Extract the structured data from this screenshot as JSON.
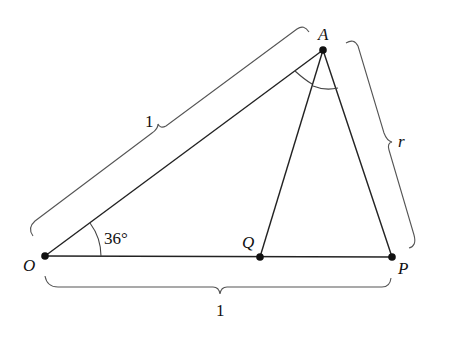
{
  "figure": {
    "points": {
      "O": {
        "label": "O",
        "x": 45,
        "y": 256
      },
      "Q": {
        "label": "Q",
        "x": 260,
        "y": 257
      },
      "P": {
        "label": "P",
        "x": 392,
        "y": 257
      },
      "A": {
        "label": "A",
        "x": 323,
        "y": 50
      }
    },
    "angle_label": "36°",
    "brace_labels": {
      "OA": "1",
      "OP": "1",
      "AP": "r"
    },
    "colors": {
      "line": "#222222",
      "brace": "#555555",
      "point": "#111111",
      "background": "#ffffff"
    }
  }
}
